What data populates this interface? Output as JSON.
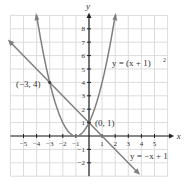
{
  "chart_data": {
    "type": "line",
    "title": "",
    "xlabel": "x",
    "ylabel": "y",
    "xlim": [
      -6,
      6
    ],
    "ylim": [
      -3,
      9
    ],
    "grid": true,
    "x_ticks": [
      "−5",
      "−4",
      "−3",
      "−2",
      "−1",
      "1",
      "2",
      "3",
      "4",
      "5"
    ],
    "y_ticks": [
      "8",
      "7",
      "6",
      "5",
      "4",
      "3",
      "2",
      "1",
      "−1",
      "−2"
    ],
    "series": [
      {
        "name": "y = (x + 1)^2",
        "label": "y = (x + 1)",
        "sup": "2",
        "type": "parabola",
        "equation": "y=(x+1)^2",
        "color": "#7f7f7f"
      },
      {
        "name": "y = −x + 1",
        "label": "y = −x + 1",
        "type": "line",
        "equation": "y=-x+1",
        "color": "#7f7f7f"
      }
    ],
    "annotations": [
      {
        "text": "(−3, 4)",
        "x": -3,
        "y": 4
      },
      {
        "text": "(0, 1)",
        "x": 0,
        "y": 1
      }
    ]
  }
}
